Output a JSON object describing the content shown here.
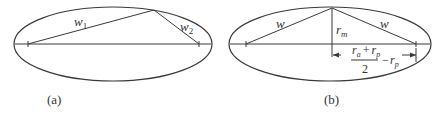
{
  "figure": {
    "panels": [
      {
        "id": "a",
        "caption": "(a)",
        "labels": {
          "w1_base": "w",
          "w1_sub": "1",
          "w2_base": "w",
          "w2_sub": "2"
        }
      },
      {
        "id": "b",
        "caption": "(b)",
        "labels": {
          "w_left": "w",
          "w_right": "w",
          "rm_base": "r",
          "rm_sub": "m",
          "frac_num_ra": "r",
          "frac_num_ra_sub": "a",
          "frac_num_plus": "+",
          "frac_num_rp": "r",
          "frac_num_rp_sub": "p",
          "frac_den": "2",
          "minus": "−",
          "rp_base": "r",
          "rp_sub": "p"
        }
      }
    ],
    "colors": {
      "line": "#3a3a3a",
      "text": "#333333",
      "background": "#ffffff"
    }
  }
}
